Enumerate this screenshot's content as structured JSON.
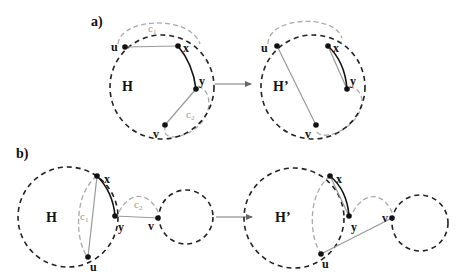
{
  "panels": {
    "a": {
      "label": "a)",
      "before": {
        "graph_label": "H",
        "vertices": {
          "u": "u",
          "x": "x",
          "y": "y",
          "v": "v"
        },
        "cycles": {
          "c1": "c",
          "c1_sub": "1",
          "c2": "c",
          "c2_sub": "2"
        }
      },
      "after": {
        "graph_label": "H’",
        "vertices": {
          "u": "u",
          "x": "x",
          "y": "y",
          "v": "v"
        }
      }
    },
    "b": {
      "label": "b)",
      "before": {
        "graph_label": "H",
        "vertices": {
          "u": "u",
          "x": "x",
          "y": "y",
          "v": "v"
        },
        "cycles": {
          "c1": "c",
          "c1_sub": "1",
          "c2": "c",
          "c2_sub": "2"
        }
      },
      "after": {
        "graph_label": "H’",
        "vertices": {
          "u": "u",
          "x": "x",
          "y": "y",
          "v": "v"
        }
      }
    }
  },
  "colors": {
    "dashed_circle": "#222222",
    "cycle_dashed": "#aaaaaa",
    "edge_gray": "#999999",
    "edge_bold": "#111111",
    "arrow": "#777777"
  }
}
